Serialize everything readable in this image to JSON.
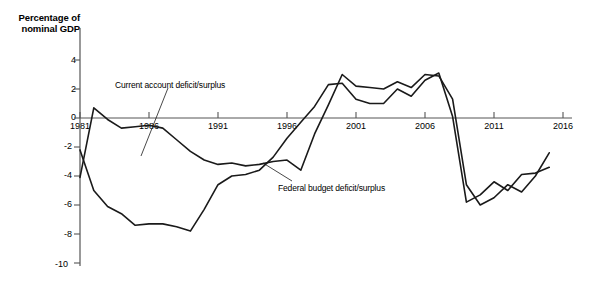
{
  "axis_label": {
    "line1": "Percentage of",
    "line2": "nominal GDP"
  },
  "annotations": {
    "current_account": "Current account deficit/surplus",
    "federal_budget": "Federal budget deficit/surplus"
  },
  "colors": {
    "line": "#1a1a1a",
    "axis": "#555555",
    "background": "#ffffff"
  },
  "chart_data": {
    "type": "line",
    "title": "",
    "subtitle": "",
    "xlabel": "",
    "ylabel": "Percentage of nominal GDP",
    "xlim": [
      1981,
      2016
    ],
    "ylim": [
      -10,
      5
    ],
    "yticks": [
      4,
      2,
      0,
      -2,
      -4,
      -6,
      -8,
      -10
    ],
    "ytick_labels": [
      "4",
      "2",
      "0",
      "-2",
      "-4",
      "-6",
      "-8",
      "-10"
    ],
    "xticks": [
      1981,
      1986,
      1991,
      1996,
      2001,
      2006,
      2011,
      2016
    ],
    "xtick_labels": [
      "1981",
      "1986",
      "1991",
      "1996",
      "2001",
      "2006",
      "2011",
      "2016"
    ],
    "grid": false,
    "legend": "annotated-inline",
    "x": [
      1981,
      1982,
      1983,
      1984,
      1985,
      1986,
      1987,
      1988,
      1989,
      1990,
      1991,
      1992,
      1993,
      1994,
      1995,
      1996,
      1997,
      1998,
      1999,
      2000,
      2001,
      2002,
      2003,
      2004,
      2005,
      2006,
      2007,
      2008,
      2009,
      2010,
      2011,
      2012,
      2013,
      2014,
      2015
    ],
    "series": [
      {
        "name": "Current account deficit/surplus",
        "label": "Current account deficit/surplus",
        "values": [
          -2.2,
          -5.0,
          -6.1,
          -6.6,
          -7.4,
          -7.3,
          -7.3,
          -7.5,
          -7.8,
          -6.3,
          -4.6,
          -4.0,
          -3.9,
          -3.6,
          -2.7,
          -1.4,
          -0.3,
          0.8,
          2.3,
          2.4,
          1.3,
          1.0,
          1.0,
          2.0,
          1.5,
          2.6,
          3.1,
          0.1,
          -5.8,
          -5.3,
          -4.4,
          -5.0,
          -3.9,
          -3.8,
          -3.4
        ]
      },
      {
        "name": "Federal budget deficit/surplus",
        "label": "Federal budget deficit/surplus",
        "values": [
          -4.1,
          0.7,
          -0.1,
          -0.7,
          -0.6,
          -0.5,
          -0.7,
          -1.5,
          -2.3,
          -2.9,
          -3.2,
          -3.1,
          -3.3,
          -3.2,
          -3.0,
          -2.9,
          -3.6,
          -1.1,
          0.9,
          3.0,
          2.2,
          2.1,
          2.0,
          2.5,
          2.1,
          3.0,
          2.9,
          1.3,
          -4.6,
          -6.0,
          -5.5,
          -4.6,
          -5.1,
          -4.0,
          -2.4
        ]
      }
    ]
  }
}
